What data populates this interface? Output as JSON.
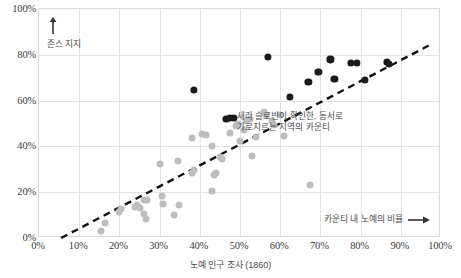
{
  "chart_data": {
    "type": "scatter",
    "title": "",
    "xlabel": "노예 인구 조사 (1860)",
    "ylabel": "",
    "xlim": [
      0,
      100
    ],
    "ylim": [
      0,
      100
    ],
    "grid": true,
    "legend_position": "none",
    "xticks": [
      "0%",
      "10%",
      "20%",
      "30%",
      "40%",
      "50%",
      "60%",
      "70%",
      "80%",
      "90%",
      "100%"
    ],
    "yticks": [
      "0%",
      "20%",
      "40%",
      "60%",
      "80%",
      "100%"
    ],
    "axis_captions": {
      "y_up": "존스 지지",
      "x_right": "카운티 내 노예의 비율"
    },
    "annotations": [
      {
        "id": "slobin-belt",
        "text": "새라 슬로빈이 확인한, 동서로\n가로지르는 지역의 카운티",
        "x": 40,
        "y": 47
      }
    ],
    "colors": {
      "light_point": "#bdbdbd",
      "dark_point": "#1a1a1a",
      "grid": "#e3e3e3",
      "axis_text": "#3c3c3c",
      "annotation_text": "#4d4d4d",
      "trendline": "#111111"
    },
    "trendline": {
      "style": "dashed",
      "x_start": 5.5,
      "y_start": 0,
      "x_end": 98,
      "y_end": 85
    },
    "series": [
      {
        "name": "기타 카운티",
        "color": "#bdbdbd",
        "points": [
          [
            15.5,
            3.0
          ],
          [
            16.5,
            6.5
          ],
          [
            20.0,
            11.5
          ],
          [
            20.5,
            12.5
          ],
          [
            24.0,
            13.5
          ],
          [
            24.5,
            14.5
          ],
          [
            25.0,
            13.0
          ],
          [
            26.0,
            16.5
          ],
          [
            26.8,
            16.5
          ],
          [
            26.0,
            10.5
          ],
          [
            26.5,
            8.5
          ],
          [
            30.0,
            32.5
          ],
          [
            30.5,
            18.5
          ],
          [
            30.8,
            15.0
          ],
          [
            33.5,
            10.0
          ],
          [
            34.5,
            33.5
          ],
          [
            34.8,
            14.5
          ],
          [
            38.0,
            28.5
          ],
          [
            38.5,
            29.5
          ],
          [
            38.0,
            43.5
          ],
          [
            40.5,
            45.5
          ],
          [
            41.5,
            45.0
          ],
          [
            43.0,
            40.0
          ],
          [
            43.5,
            27.5
          ],
          [
            44.0,
            28.5
          ],
          [
            43.0,
            20.5
          ],
          [
            45.0,
            35.5
          ],
          [
            45.5,
            34.5
          ],
          [
            47.0,
            52.0
          ],
          [
            47.5,
            46.0
          ],
          [
            49.0,
            49.0
          ],
          [
            49.5,
            50.0
          ],
          [
            50.0,
            42.5
          ],
          [
            51.0,
            47.0
          ],
          [
            51.5,
            51.0
          ],
          [
            52.5,
            52.0
          ],
          [
            53.0,
            36.0
          ],
          [
            54.0,
            44.0
          ],
          [
            56.0,
            55.0
          ],
          [
            56.5,
            53.5
          ],
          [
            58.0,
            51.0
          ],
          [
            58.5,
            49.5
          ],
          [
            60.0,
            53.5
          ],
          [
            61.0,
            44.5
          ],
          [
            67.5,
            23.0
          ]
        ]
      },
      {
        "name": "새라 슬로빈이 확인한 동서 지역 카운티",
        "color": "#1a1a1a",
        "points": [
          [
            46.5,
            52.0
          ],
          [
            47.5,
            52.5
          ],
          [
            48.5,
            52.5
          ],
          [
            38.5,
            64.5
          ],
          [
            57.0,
            79.0
          ],
          [
            62.5,
            61.5
          ],
          [
            67.0,
            68.0
          ],
          [
            69.5,
            72.5
          ],
          [
            72.5,
            78.0
          ],
          [
            73.5,
            69.5
          ],
          [
            77.5,
            76.5
          ],
          [
            79.0,
            76.5
          ],
          [
            81.0,
            69.0
          ],
          [
            86.5,
            77.0
          ],
          [
            87.0,
            76.0
          ]
        ]
      }
    ]
  }
}
